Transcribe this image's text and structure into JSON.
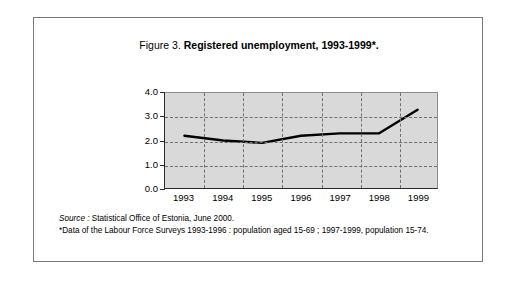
{
  "figure": {
    "title_prefix": "Figure 3.",
    "title_main": "Registered unemployment, 1993-1999*.",
    "source_word": "Source :",
    "source_text": " Statistical Office of Estonia, June 2000.",
    "note_text": "*Data of the Labour Force Surveys 1993-1996 : population aged 15-69 ; 1997-1999, population 15-74."
  },
  "chart_data": {
    "type": "line",
    "title": "Figure 3. Registered unemployment, 1993-1999*.",
    "xlabel": "",
    "ylabel": "",
    "categories": [
      "1993",
      "1994",
      "1995",
      "1996",
      "1997",
      "1998",
      "1999"
    ],
    "values": [
      2.2,
      2.0,
      1.9,
      2.2,
      2.3,
      2.3,
      3.3
    ],
    "series": [
      {
        "name": "Registered unemployment",
        "values": [
          2.2,
          2.0,
          1.9,
          2.2,
          2.3,
          2.3,
          3.3
        ],
        "color": "#000000"
      }
    ],
    "ylim": [
      0.0,
      4.0
    ],
    "ytick_labels": [
      "4.0",
      "3.0",
      "2.0",
      "1.0",
      "0.0"
    ],
    "ytick_values": [
      4.0,
      3.0,
      2.0,
      1.0,
      0.0
    ],
    "grid": true,
    "grid_style": "dashed",
    "legend": "none",
    "plot_background": "#d9d9d9",
    "line_color": "#000000"
  }
}
